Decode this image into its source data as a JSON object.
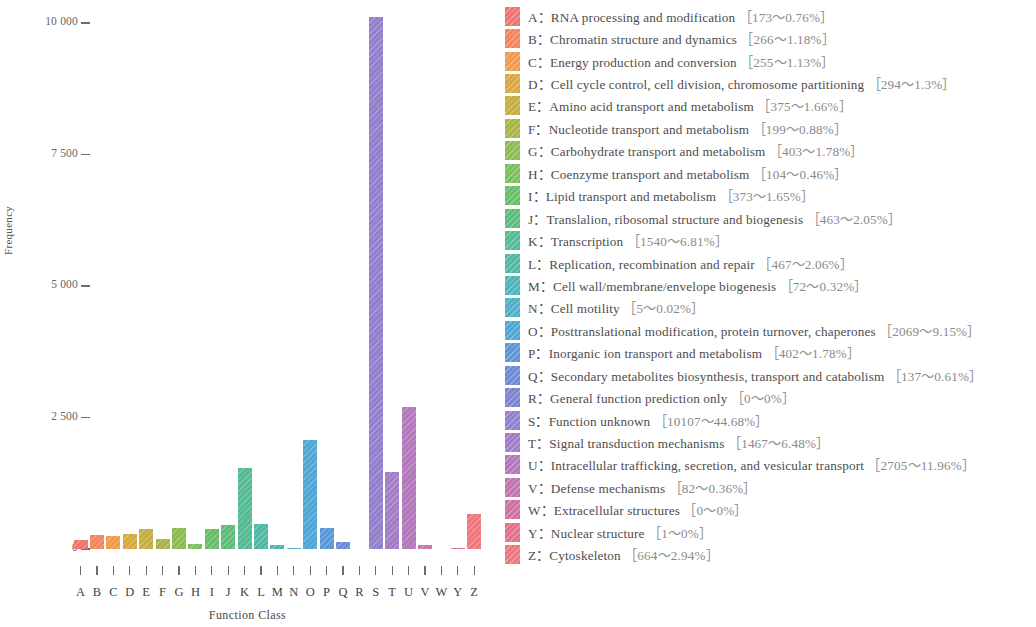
{
  "chart_data": {
    "type": "bar",
    "title": "",
    "xlabel": "Function Class",
    "ylabel": "Frequency",
    "ylim": [
      0,
      10600
    ],
    "grid": false,
    "legend_position": "right",
    "categories": [
      "A",
      "B",
      "C",
      "D",
      "E",
      "F",
      "G",
      "H",
      "I",
      "J",
      "K",
      "L",
      "M",
      "N",
      "O",
      "P",
      "Q",
      "R",
      "S",
      "T",
      "U",
      "V",
      "W",
      "Y",
      "Z"
    ],
    "values": [
      173,
      266,
      255,
      294,
      375,
      199,
      403,
      104,
      373,
      463,
      1540,
      467,
      72,
      5,
      2069,
      402,
      137,
      0,
      10107,
      1467,
      2705,
      82,
      0,
      1,
      664
    ],
    "percents": [
      "0.76%",
      "1.18%",
      "1.13%",
      "1.3%",
      "1.66%",
      "0.88%",
      "1.78%",
      "0.46%",
      "1.65%",
      "2.05%",
      "6.81%",
      "2.06%",
      "0.32%",
      "0.02%",
      "9.15%",
      "1.78%",
      "0.61%",
      "0%",
      "44.68%",
      "6.48%",
      "11.96%",
      "0.36%",
      "0%",
      "0%",
      "2.94%"
    ],
    "colors": [
      "#ef7471",
      "#f4845c",
      "#ef9a4e",
      "#d8a73f",
      "#c4ae3f",
      "#a8b348",
      "#8cbb52",
      "#7cbe5c",
      "#67bd68",
      "#5cbc7b",
      "#54bb92",
      "#4fb8a5",
      "#4cb5b8",
      "#4db0c6",
      "#4fa6d4",
      "#5b97d6",
      "#6d8ad4",
      "#7f83cf",
      "#9380cd",
      "#a37cc6",
      "#b277bc",
      "#c273b0",
      "#d070a0",
      "#e0708d",
      "#ef767e"
    ],
    "data_labels_visible": false
  },
  "axes": {
    "y_ticks": [
      "10 000",
      "7 500",
      "5 000",
      "2 500",
      "0"
    ],
    "y_tick_values": [
      10000,
      7500,
      5000,
      2500,
      0
    ],
    "y_title": "Frequency",
    "x_title": "Function Class"
  },
  "legend": {
    "items": [
      {
        "key": "A",
        "sep": "：",
        "label": "RNA processing and modification",
        "value": "［173～0.76%］",
        "color": "#ef7471"
      },
      {
        "key": "B",
        "sep": "：",
        "label": "Chromatin structure and dynamics",
        "value": "［266～1.18%］",
        "color": "#f4845c"
      },
      {
        "key": "C",
        "sep": "：",
        "label": "Energy production and conversion",
        "value": "［255～1.13%］",
        "color": "#ef9a4e"
      },
      {
        "key": "D",
        "sep": "：",
        "label": "Cell cycle control, cell division, chromosome partitioning",
        "value": "［294～1.3%］",
        "color": "#d8a73f"
      },
      {
        "key": "E",
        "sep": "：",
        "label": "Amino acid transport and metabolism",
        "value": "［375～1.66%］",
        "color": "#c4ae3f"
      },
      {
        "key": "F",
        "sep": "：",
        "label": "Nucleotide transport and metabolism",
        "value": "［199～0.88%］",
        "color": "#a8b348"
      },
      {
        "key": "G",
        "sep": "：",
        "label": "Carbohydrate transport and metabolism",
        "value": "［403～1.78%］",
        "color": "#8cbb52"
      },
      {
        "key": "H",
        "sep": "：",
        "label": "Coenzyme transport and metabolism",
        "value": "［104～0.46%］",
        "color": "#7cbe5c"
      },
      {
        "key": "I",
        "sep": "：",
        "label": "Lipid transport and metabolism",
        "value": "［373～1.65%］",
        "color": "#67bd68"
      },
      {
        "key": "J",
        "sep": "：",
        "label": "Translalion, ribosomal structure and biogenesis",
        "value": "［463～2.05%］",
        "color": "#5cbc7b"
      },
      {
        "key": "K",
        "sep": "：",
        "label": "Transcription",
        "value": "［1540～6.81%］",
        "color": "#54bb92"
      },
      {
        "key": "L",
        "sep": "：",
        "label": "Replication, recombination and repair",
        "value": "［467～2.06%］",
        "color": "#4fb8a5"
      },
      {
        "key": "M",
        "sep": "：",
        "label": "Cell wall/membrane/envelope biogenesis",
        "value": "［72～0.32%］",
        "color": "#4cb5b8"
      },
      {
        "key": "N",
        "sep": "：",
        "label": "Cell motility",
        "value": "［5～0.02%］",
        "color": "#4db0c6"
      },
      {
        "key": "O",
        "sep": "：",
        "label": "Posttranslational modification, protein turnover, chaperones",
        "value": "［2069～9.15%］",
        "color": "#4fa6d4"
      },
      {
        "key": "P",
        "sep": "：",
        "label": "Inorganic ion transport and metabolism",
        "value": "［402～1.78%］",
        "color": "#5b97d6"
      },
      {
        "key": "Q",
        "sep": "：",
        "label": "Secondary metabolites biosynthesis, transport and catabolism",
        "value": "［137～0.61%］",
        "color": "#6d8ad4"
      },
      {
        "key": "R",
        "sep": "：",
        "label": "General function prediction only",
        "value": "［0～0%］",
        "color": "#7f83cf"
      },
      {
        "key": "S",
        "sep": "：",
        "label": "Function unknown",
        "value": "［10107～44.68%］",
        "color": "#9380cd"
      },
      {
        "key": "T",
        "sep": "：",
        "label": "Signal transduction mechanisms",
        "value": "［1467～6.48%］",
        "color": "#a37cc6"
      },
      {
        "key": "U",
        "sep": "：",
        "label": "Intracellular trafficking, secretion, and vesicular transport",
        "value": "［2705～11.96%］",
        "color": "#b277bc"
      },
      {
        "key": "V",
        "sep": "：",
        "label": "Defense mechanisms",
        "value": "［82～0.36%］",
        "color": "#c273b0"
      },
      {
        "key": "W",
        "sep": "：",
        "label": "Extracellular structures",
        "value": "［0～0%］",
        "color": "#d070a0"
      },
      {
        "key": "Y",
        "sep": "：",
        "label": "Nuclear structure",
        "value": "［1～0%］",
        "color": "#e0708d"
      },
      {
        "key": "Z",
        "sep": "：",
        "label": "Cytoskeleton",
        "value": "［664～2.94%］",
        "color": "#ef767e"
      }
    ]
  }
}
